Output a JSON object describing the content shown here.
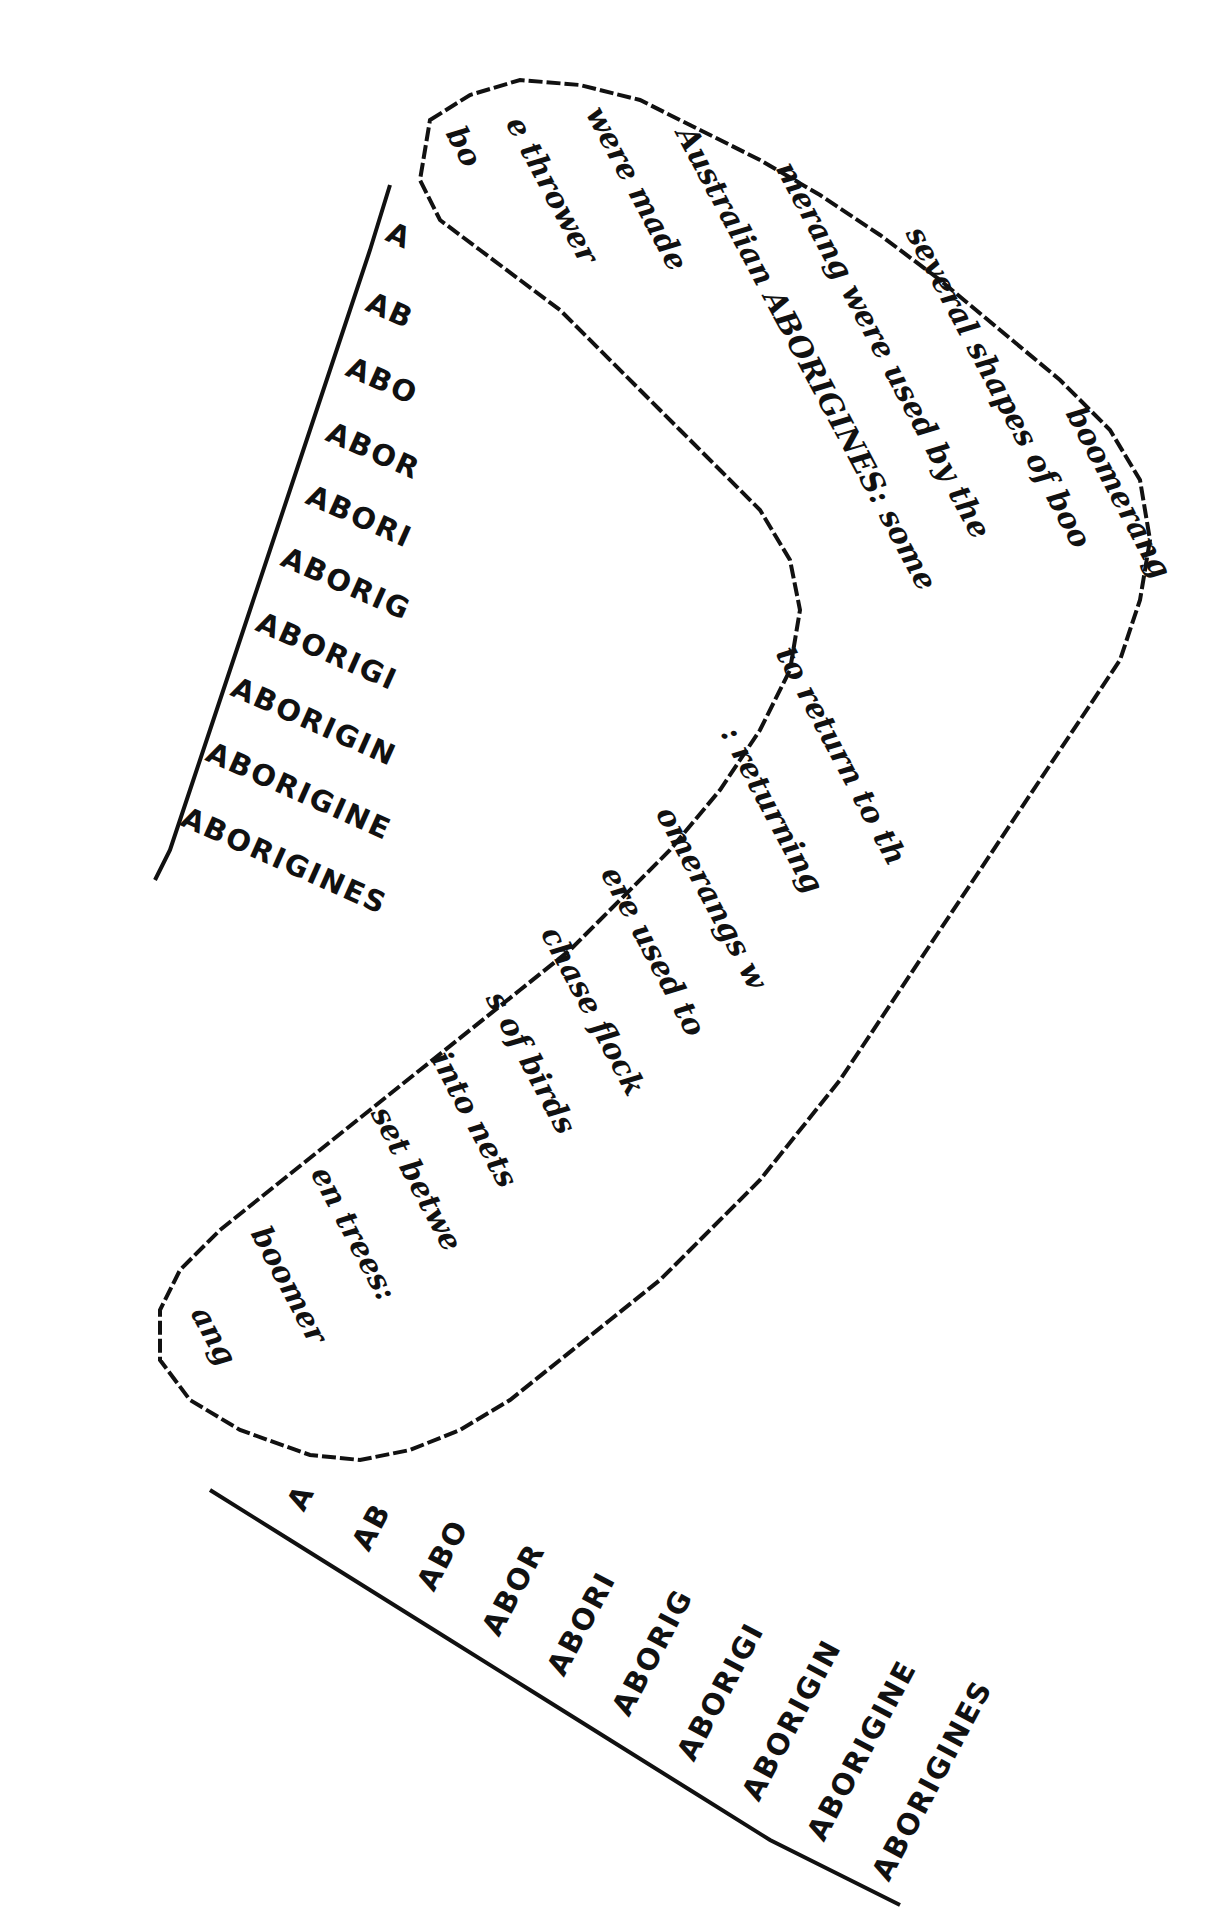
{
  "artwork": {
    "title": "Boomerang calligram",
    "ink_color": "#111111",
    "background_color": "#ffffff"
  },
  "left_ladder": {
    "rows": [
      "A",
      "AB",
      "ABO",
      "ABOR",
      "ABORI",
      "ABORIG",
      "ABORIGI",
      "ABORIGIN",
      "ABORIGINE",
      "ABORIGINES"
    ]
  },
  "bottom_ladder": {
    "rows": [
      "A",
      "AB",
      "ABO",
      "ABOR",
      "ABORI",
      "ABORIG",
      "ABORIGI",
      "ABORIGIN",
      "ABORIGINE",
      "ABORIGINES"
    ]
  },
  "boomerang_text": {
    "upper_arm_lines": [
      "boomerang",
      "several shapes of boo",
      "merang were used by the",
      "Australian ABORIGINES: some",
      "were made",
      "e thrower",
      "bo"
    ],
    "lower_arm_lines": [
      "to return to th",
      ": returning",
      "omerangs w",
      "ere used to",
      "chase flock",
      "s of birds",
      "into nets",
      "set betwe",
      "en trees:",
      "boomer",
      "ang"
    ]
  }
}
